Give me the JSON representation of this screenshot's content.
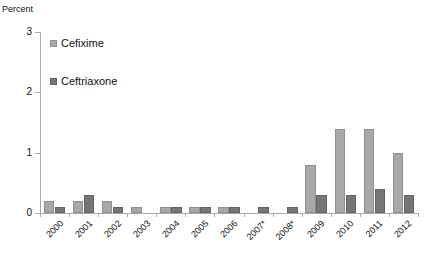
{
  "chart_data": {
    "type": "bar",
    "title": "",
    "subtitle": "",
    "xlabel": "",
    "ylabel": "Percent",
    "ylim": [
      0,
      3
    ],
    "yticks": [
      0,
      1,
      2,
      3
    ],
    "ytick_labels": [
      "0",
      "1",
      "2",
      "3"
    ],
    "grid": false,
    "legend_position": "upper-left-inside",
    "categories": [
      "2000",
      "2001",
      "2002",
      "2003",
      "2004",
      "2005",
      "2006",
      "2007*",
      "2008*",
      "2009",
      "2010",
      "2011",
      "2012"
    ],
    "series": [
      {
        "name": "Cefixime",
        "color": "#a8a8a8",
        "values": [
          0.2,
          0.2,
          0.2,
          0.1,
          0.1,
          0.1,
          0.1,
          0.0,
          0.0,
          0.8,
          1.4,
          1.4,
          1.0
        ]
      },
      {
        "name": "Ceftriaxone",
        "color": "#767676",
        "values": [
          0.1,
          0.3,
          0.1,
          0.0,
          0.1,
          0.1,
          0.1,
          0.1,
          0.1,
          0.3,
          0.3,
          0.4,
          0.3
        ]
      }
    ],
    "annotations": []
  }
}
